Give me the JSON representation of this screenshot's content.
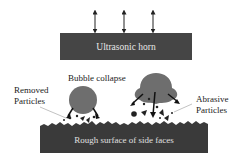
{
  "diagram": {
    "horn": {
      "label": "Ultrasonic horn",
      "color": "#454545"
    },
    "surface": {
      "label": "Rough surface of side faces",
      "color": "#3a3a3a"
    },
    "bubble_color": "#6e6e6e",
    "labels": {
      "bubble_collapse": "Bubble collapse",
      "removed_particles_line1": "Removed",
      "removed_particles_line2": "Particles",
      "abrasive_particles_line1": "Abrasive",
      "abrasive_particles_line2": "Particles"
    },
    "vibration_arrows": [
      {
        "x": 95
      },
      {
        "x": 124
      },
      {
        "x": 153
      }
    ]
  }
}
